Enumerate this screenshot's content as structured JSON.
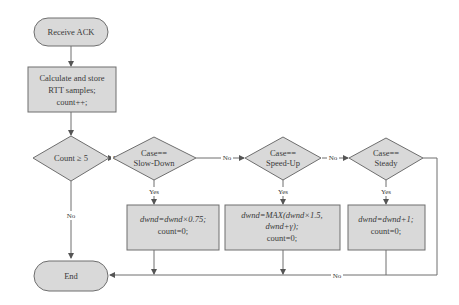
{
  "diagram": {
    "type": "flowchart",
    "nodes": {
      "start": {
        "shape": "terminal",
        "label": "Receive ACK"
      },
      "calc": {
        "shape": "process",
        "lines": [
          "Calculate and store",
          "RTT samples;",
          "count++;"
        ]
      },
      "count_check": {
        "shape": "decision",
        "label": "Count ≥ 5"
      },
      "slow_down": {
        "shape": "decision",
        "lines": [
          "Case==",
          "Slow-Down"
        ]
      },
      "speed_up": {
        "shape": "decision",
        "lines": [
          "Case==",
          "Speed-Up"
        ]
      },
      "steady": {
        "shape": "decision",
        "lines": [
          "Case==",
          "Steady"
        ]
      },
      "action_slow": {
        "shape": "process",
        "lines": [
          "dwnd=dwnd×0.75;",
          "count=0;"
        ]
      },
      "action_speed": {
        "shape": "process",
        "lines": [
          "dwnd=MAX(dwnd×1.5,",
          "dwnd+γ);",
          "count=0;"
        ]
      },
      "action_steady": {
        "shape": "process",
        "lines": [
          "dwnd=dwnd+1;",
          "count=0;"
        ]
      },
      "end": {
        "shape": "terminal",
        "label": "End"
      }
    },
    "edge_labels": {
      "count_yes": "Yes",
      "count_no": "No",
      "slow_yes": "Yes",
      "slow_no": "No",
      "speed_yes": "Yes",
      "speed_no": "No",
      "steady_yes": "Yes",
      "steady_no": "No"
    },
    "colors": {
      "node_fill": "#d9d9d9",
      "stroke": "#6e6e6e",
      "text": "#3a3a3a",
      "background": "#ffffff"
    }
  }
}
